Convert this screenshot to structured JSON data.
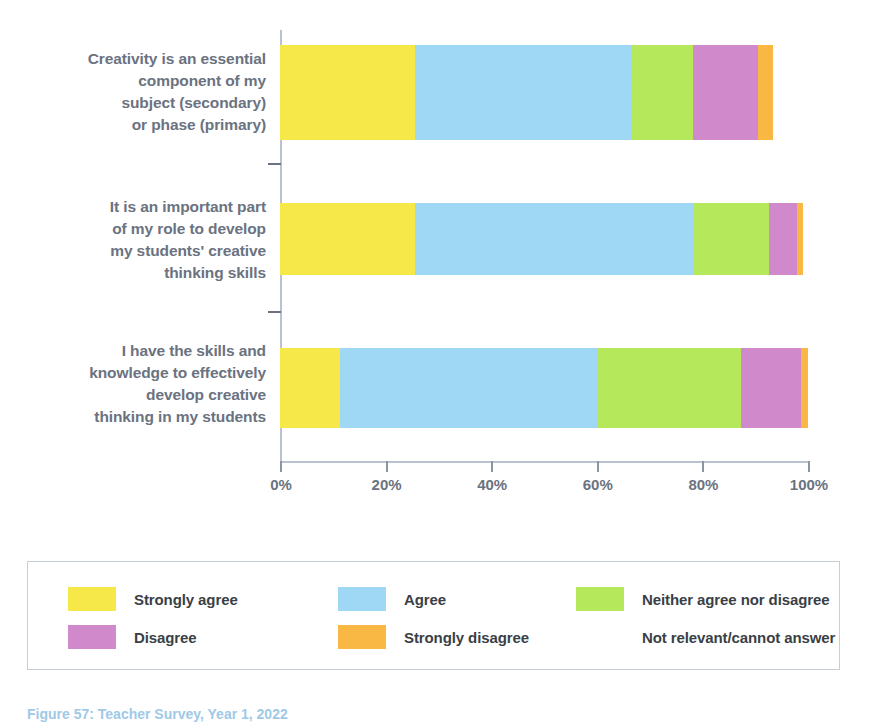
{
  "chart_data": {
    "type": "bar",
    "orientation": "horizontal",
    "stacked": true,
    "normalized_percent": true,
    "title": "",
    "xlabel": "",
    "ylabel": "",
    "xlim": [
      0,
      100
    ],
    "grid": false,
    "legend_position": "bottom",
    "xticks": [
      {
        "value": 0,
        "label": "0%"
      },
      {
        "value": 20,
        "label": "20%"
      },
      {
        "value": 40,
        "label": "40%"
      },
      {
        "value": 60,
        "label": "60%"
      },
      {
        "value": 80,
        "label": "80%"
      },
      {
        "value": 100,
        "label": "100%"
      }
    ],
    "categories": [
      "Creativity is an essential component of my subject (secondary) or phase (primary)",
      "It is an important part of my role to develop my students' creative thinking skills",
      "I have the skills and knowledge to effectively develop creative thinking in my students"
    ],
    "category_lines": [
      [
        "Creativity is an essential",
        "component of my",
        "subject (secondary)",
        "or phase (primary)"
      ],
      [
        "It is an important part",
        "of my role to develop",
        "my students' creative",
        "thinking skills"
      ],
      [
        "I have the skills and",
        "knowledge to effectively",
        "develop creative",
        "thinking in my students"
      ]
    ],
    "series": [
      {
        "name": "Strongly agree",
        "color": "#F7E849",
        "values": [
          25.6,
          25.6,
          11.4
        ]
      },
      {
        "name": "Agree",
        "color": "#9FD8F5",
        "values": [
          41.1,
          52.6,
          48.9
        ]
      },
      {
        "name": "Neither agree nor disagree",
        "color": "#B5E85A",
        "values": [
          11.6,
          14.4,
          27.1
        ]
      },
      {
        "name": "Disagree",
        "color": "#D08ACB",
        "values": [
          12.3,
          5.3,
          11.2
        ]
      },
      {
        "name": "Strongly disagree",
        "color": "#F9B843",
        "values": [
          2.8,
          1.1,
          1.5
        ]
      },
      {
        "name": "Not relevant/cannot answer",
        "color": "#FFFFFF",
        "values": [
          6.6,
          1.0,
          0.0
        ]
      }
    ]
  },
  "legend": {
    "entries": [
      {
        "label": "Strongly agree",
        "color": "#F7E849",
        "has_swatch": true
      },
      {
        "label": "Agree",
        "color": "#9FD8F5",
        "has_swatch": true
      },
      {
        "label": "Neither agree nor disagree",
        "color": "#B5E85A",
        "has_swatch": true
      },
      {
        "label": "Disagree",
        "color": "#D08ACB",
        "has_swatch": true
      },
      {
        "label": "Strongly disagree",
        "color": "#F9B843",
        "has_swatch": true
      },
      {
        "label": "Not relevant/cannot answer",
        "color": "#FFFFFF",
        "has_swatch": false
      }
    ]
  },
  "caption": {
    "text": "Figure 57: Teacher Survey, Year 1, 2022"
  },
  "colors": {
    "axis": "#b9c3cf",
    "tick": "#8b95a3",
    "category_label": "#6b7280",
    "legend_border": "#c7ced8",
    "legend_text": "#3a3f46",
    "caption": "#9fc9e6"
  }
}
